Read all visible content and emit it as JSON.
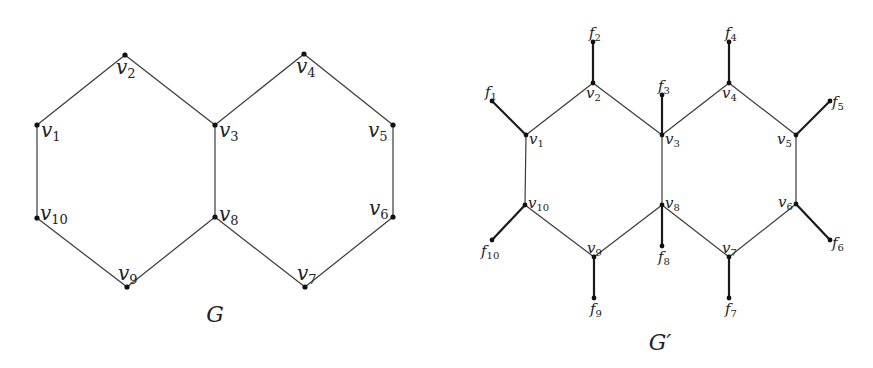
{
  "figure": {
    "graphs": [
      {
        "id": "G",
        "caption": "G",
        "caption_pos": [
          215,
          322
        ],
        "nodes": [
          {
            "id": "v1",
            "label": "v",
            "sub": "1",
            "x": 37,
            "y": 125,
            "lx": 41,
            "ly": 137
          },
          {
            "id": "v2",
            "label": "v",
            "sub": "2",
            "x": 125,
            "y": 55,
            "lx": 116,
            "ly": 74
          },
          {
            "id": "v3",
            "label": "v",
            "sub": "3",
            "x": 215,
            "y": 125,
            "lx": 219,
            "ly": 137
          },
          {
            "id": "v4",
            "label": "v",
            "sub": "4",
            "x": 304,
            "y": 54,
            "lx": 296,
            "ly": 73
          },
          {
            "id": "v5",
            "label": "v",
            "sub": "5",
            "x": 393,
            "y": 125,
            "lx": 368,
            "ly": 137
          },
          {
            "id": "v6",
            "label": "v",
            "sub": "6",
            "x": 393,
            "y": 217,
            "lx": 369,
            "ly": 215
          },
          {
            "id": "v7",
            "label": "v",
            "sub": "7",
            "x": 305,
            "y": 287,
            "lx": 297,
            "ly": 280
          },
          {
            "id": "v8",
            "label": "v",
            "sub": "8",
            "x": 215,
            "y": 217,
            "lx": 219,
            "ly": 221
          },
          {
            "id": "v9",
            "label": "v",
            "sub": "9",
            "x": 127,
            "y": 287,
            "lx": 118,
            "ly": 280
          },
          {
            "id": "v10",
            "label": "v",
            "sub": "10",
            "x": 37,
            "y": 218,
            "lx": 40,
            "ly": 220
          }
        ],
        "edges": [
          [
            "v1",
            "v2"
          ],
          [
            "v2",
            "v3"
          ],
          [
            "v3",
            "v4"
          ],
          [
            "v4",
            "v5"
          ],
          [
            "v5",
            "v6"
          ],
          [
            "v6",
            "v7"
          ],
          [
            "v7",
            "v8"
          ],
          [
            "v8",
            "v9"
          ],
          [
            "v9",
            "v10"
          ],
          [
            "v10",
            "v1"
          ],
          [
            "v3",
            "v8"
          ]
        ]
      },
      {
        "id": "G_prime",
        "caption": "G′",
        "caption_pos": [
          660,
          350
        ],
        "nodes": [
          {
            "id": "v1",
            "label": "v",
            "sub": "1",
            "x": 526,
            "y": 135,
            "lx": 529,
            "ly": 144
          },
          {
            "id": "v2",
            "label": "v",
            "sub": "2",
            "x": 593,
            "y": 83,
            "lx": 586,
            "ly": 98
          },
          {
            "id": "v3",
            "label": "v",
            "sub": "3",
            "x": 662,
            "y": 135,
            "lx": 665,
            "ly": 144
          },
          {
            "id": "v4",
            "label": "v",
            "sub": "4",
            "x": 729,
            "y": 83,
            "lx": 722,
            "ly": 98
          },
          {
            "id": "v5",
            "label": "v",
            "sub": "5",
            "x": 796,
            "y": 135,
            "lx": 777,
            "ly": 144
          },
          {
            "id": "v6",
            "label": "v",
            "sub": "6",
            "x": 796,
            "y": 204,
            "lx": 778,
            "ly": 207
          },
          {
            "id": "v7",
            "label": "v",
            "sub": "7",
            "x": 729,
            "y": 257,
            "lx": 722,
            "ly": 253
          },
          {
            "id": "v8",
            "label": "v",
            "sub": "8",
            "x": 662,
            "y": 205,
            "lx": 665,
            "ly": 208
          },
          {
            "id": "v9",
            "label": "v",
            "sub": "9",
            "x": 594,
            "y": 257,
            "lx": 587,
            "ly": 253
          },
          {
            "id": "v10",
            "label": "v",
            "sub": "10",
            "x": 525,
            "y": 205,
            "lx": 528,
            "ly": 208
          },
          {
            "id": "f1",
            "label": "f",
            "sub": "1",
            "x": 492,
            "y": 101,
            "lx": 485,
            "ly": 97
          },
          {
            "id": "f2",
            "label": "f",
            "sub": "2",
            "x": 593,
            "y": 42,
            "lx": 589,
            "ly": 38
          },
          {
            "id": "f3",
            "label": "f",
            "sub": "3",
            "x": 662,
            "y": 95,
            "lx": 658,
            "ly": 91
          },
          {
            "id": "f4",
            "label": "f",
            "sub": "4",
            "x": 729,
            "y": 42,
            "lx": 725,
            "ly": 38
          },
          {
            "id": "f5",
            "label": "f",
            "sub": "5",
            "x": 830,
            "y": 101,
            "lx": 832,
            "ly": 107
          },
          {
            "id": "f6",
            "label": "f",
            "sub": "6",
            "x": 830,
            "y": 240,
            "lx": 832,
            "ly": 248
          },
          {
            "id": "f7",
            "label": "f",
            "sub": "7",
            "x": 729,
            "y": 298,
            "lx": 725,
            "ly": 314
          },
          {
            "id": "f8",
            "label": "f",
            "sub": "8",
            "x": 662,
            "y": 246,
            "lx": 658,
            "ly": 262
          },
          {
            "id": "f9",
            "label": "f",
            "sub": "9",
            "x": 594,
            "y": 298,
            "lx": 590,
            "ly": 314
          },
          {
            "id": "f10",
            "label": "f",
            "sub": "10",
            "x": 492,
            "y": 240,
            "lx": 481,
            "ly": 256
          }
        ],
        "edges": [
          [
            "v1",
            "v2"
          ],
          [
            "v2",
            "v3"
          ],
          [
            "v3",
            "v4"
          ],
          [
            "v4",
            "v5"
          ],
          [
            "v5",
            "v6"
          ],
          [
            "v6",
            "v7"
          ],
          [
            "v7",
            "v8"
          ],
          [
            "v8",
            "v9"
          ],
          [
            "v9",
            "v10"
          ],
          [
            "v10",
            "v1"
          ],
          [
            "v3",
            "v8"
          ]
        ],
        "pendant_edges": [
          [
            "v1",
            "f1"
          ],
          [
            "v2",
            "f2"
          ],
          [
            "v3",
            "f3"
          ],
          [
            "v4",
            "f4"
          ],
          [
            "v5",
            "f5"
          ],
          [
            "v6",
            "f6"
          ],
          [
            "v7",
            "f7"
          ],
          [
            "v8",
            "f8"
          ],
          [
            "v9",
            "f9"
          ],
          [
            "v10",
            "f10"
          ]
        ]
      }
    ]
  }
}
